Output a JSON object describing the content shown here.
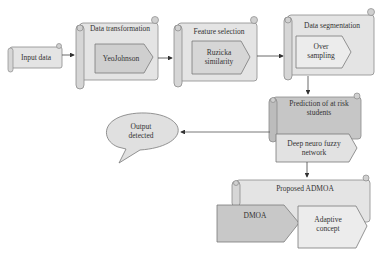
{
  "diagram": {
    "type": "flowchart",
    "nodes": {
      "input": {
        "label": "Input data"
      },
      "transform": {
        "title": "Data transformation",
        "method": "YeoJohnson"
      },
      "feature": {
        "title": "Feature selection",
        "method": "Ruzicka similarity"
      },
      "segment": {
        "title": "Data segmentation",
        "method": "Over sampling"
      },
      "predict": {
        "title": "Prediction of at risk students",
        "method": "Deep neuro fuzzy network"
      },
      "output": {
        "label": "Output detected"
      },
      "admoa": {
        "title": "Proposed ADMOA",
        "left": "DMOA",
        "right": "Adaptive concept"
      }
    },
    "edges": [
      [
        "input",
        "transform"
      ],
      [
        "transform",
        "feature"
      ],
      [
        "feature",
        "segment"
      ],
      [
        "segment",
        "predict"
      ],
      [
        "predict",
        "output"
      ],
      [
        "predict",
        "admoa"
      ]
    ],
    "colors": {
      "scroll_fill": "#e6e6e6",
      "scroll_dark": "#c4c4c4",
      "pentagon_fill": "#d0d0d0",
      "pentagon_light": "#e8e8e8",
      "stroke": "#8a8a8a",
      "arrow": "#444444"
    }
  }
}
